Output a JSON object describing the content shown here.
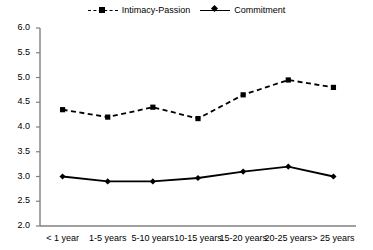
{
  "chart_data": {
    "type": "line",
    "title": "",
    "xlabel": "",
    "ylabel": "",
    "ylim": [
      2.0,
      6.0
    ],
    "ytick_values": [
      2.0,
      2.5,
      3.0,
      3.5,
      4.0,
      4.5,
      5.0,
      5.5,
      6.0
    ],
    "ytick_labels": [
      "2.0",
      "2.5",
      "3.0",
      "3.5",
      "4.0",
      "4.5",
      "5.0",
      "5.5",
      "6.0"
    ],
    "grid": false,
    "legend_position": "top-center",
    "categories": [
      "< 1 year",
      "1-5 years",
      "5-10 years",
      "10-15 years",
      "15-20 years",
      "20-25 years",
      "> 25 years"
    ],
    "series": [
      {
        "name": "Intimacy-Passion",
        "values": [
          4.35,
          4.2,
          4.4,
          4.17,
          4.65,
          4.95,
          4.8
        ],
        "line_style": "dashed",
        "marker": "square",
        "color": "#000000"
      },
      {
        "name": "Commitment",
        "values": [
          3.0,
          2.9,
          2.9,
          2.97,
          3.1,
          3.2,
          3.0
        ],
        "line_style": "solid",
        "marker": "diamond",
        "color": "#000000"
      }
    ]
  },
  "legend": {
    "entries": [
      {
        "label": "Intimacy-Passion"
      },
      {
        "label": "Commitment"
      }
    ]
  },
  "colors": {
    "axis": "#808080",
    "series": "#000000",
    "background": "#ffffff"
  }
}
